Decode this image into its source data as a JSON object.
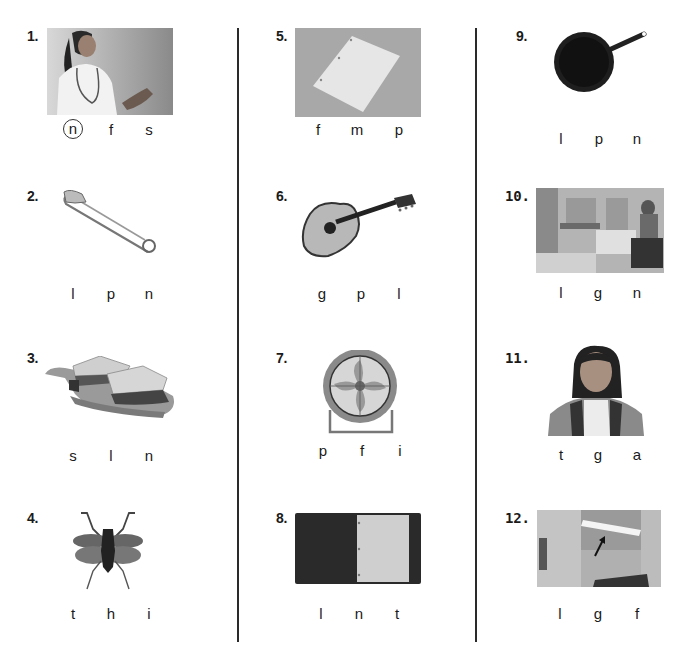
{
  "worksheet": {
    "items": [
      {
        "number": "1.",
        "picture": "nurse",
        "choices": [
          "n",
          "f",
          "s"
        ],
        "circled_index": 0
      },
      {
        "number": "2.",
        "picture": "safety pin",
        "choices": [
          "l",
          "p",
          "n"
        ],
        "circled_index": null
      },
      {
        "number": "3.",
        "picture": "sandwich",
        "choices": [
          "s",
          "l",
          "n"
        ],
        "circled_index": null
      },
      {
        "number": "4.",
        "picture": "insect",
        "choices": [
          "t",
          "h",
          "i"
        ],
        "circled_index": null
      },
      {
        "number": "5.",
        "picture": "paper",
        "choices": [
          "f",
          "m",
          "p"
        ],
        "circled_index": null
      },
      {
        "number": "6.",
        "picture": "guitar",
        "choices": [
          "g",
          "p",
          "l"
        ],
        "circled_index": null
      },
      {
        "number": "7.",
        "picture": "fan",
        "choices": [
          "p",
          "f",
          "i"
        ],
        "circled_index": null
      },
      {
        "number": "8.",
        "picture": "notebook",
        "choices": [
          "l",
          "n",
          "t"
        ],
        "circled_index": null
      },
      {
        "number": "9.",
        "picture": "pan",
        "choices": [
          "l",
          "p",
          "n"
        ],
        "circled_index": null
      },
      {
        "number": "10.",
        "picture": "library",
        "choices": [
          "l",
          "g",
          "n"
        ],
        "circled_index": null
      },
      {
        "number": "11.",
        "picture": "girl",
        "choices": [
          "t",
          "g",
          "a"
        ],
        "circled_index": null
      },
      {
        "number": "12.",
        "picture": "light",
        "choices": [
          "l",
          "g",
          "f"
        ],
        "circled_index": null
      }
    ]
  }
}
